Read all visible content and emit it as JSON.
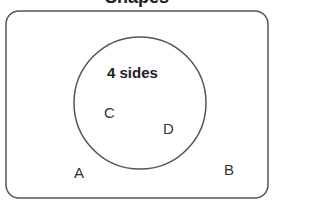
{
  "title": "Shapes",
  "diagram": {
    "type": "venn",
    "universal_set": {
      "labels": [
        "A",
        "B"
      ]
    },
    "circle": {
      "title": "4 sides",
      "labels": [
        "C",
        "D"
      ]
    }
  }
}
